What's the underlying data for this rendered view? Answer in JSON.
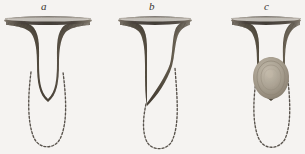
{
  "plate": {
    "title": "",
    "background_color": "#fbfaf8",
    "ink_color": "#5f574c",
    "dash_color": "#4a453d",
    "mass_color": "#a79c8c"
  },
  "figures": [
    {
      "label": "a",
      "caption_label": "a",
      "description": "funnel-shaped dark organ with rounded closed tip and dotted U-shaped outline below",
      "icon": "funnel-rounded-icon",
      "rim_left": 4,
      "rim_right": 92,
      "rim_y": 18,
      "tip_y": 97,
      "dashed_outline": "rounded-u",
      "mass": false
    },
    {
      "label": "b",
      "caption_label": "b",
      "description": "funnel-shaped dark organ cut obliquely, tapering to a point at lower left, with dotted U-shaped outline below",
      "icon": "funnel-oblique-icon",
      "rim_left": 118,
      "rim_right": 192,
      "rim_y": 18,
      "tip_y": 103,
      "dashed_outline": "rounded-u",
      "mass": false
    },
    {
      "label": "c",
      "caption_label": "c",
      "description": "funnel-shaped dark organ containing a pale ovoid mass with concentric rings at its lower end, with dotted U-shaped outline below",
      "icon": "funnel-with-ovoid-mass-icon",
      "rim_left": 230,
      "rim_right": 300,
      "rim_y": 18,
      "tip_y": 99,
      "dashed_outline": "rounded-u",
      "mass": true
    }
  ]
}
